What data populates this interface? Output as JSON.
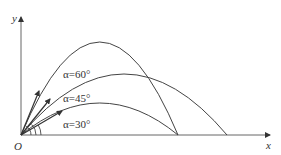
{
  "diagram": {
    "axes": {
      "x_label": "x",
      "y_label": "y",
      "origin_label": "O"
    },
    "trajectories": [
      {
        "angle_label": "α=60°",
        "angle_deg": 60,
        "peak": "highest",
        "range": "equal to 30°"
      },
      {
        "angle_label": "α=45°",
        "angle_deg": 45,
        "peak": "middle",
        "range": "maximum"
      },
      {
        "angle_label": "α=30°",
        "angle_deg": 30,
        "peak": "lowest",
        "range": "equal to 60°"
      }
    ],
    "colors": {
      "line": "#444444",
      "text": "#333333",
      "background": "#ffffff"
    }
  }
}
